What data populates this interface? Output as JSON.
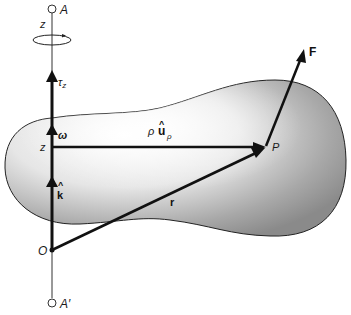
{
  "figure": {
    "colors": {
      "ink": "#111111",
      "body_light": "#f4f4f4",
      "body_dark": "#8a8a8a",
      "axis_thin": "#333333"
    },
    "labels": {
      "point_A": "A",
      "point_A_prime": "A′",
      "axis_z_top": "z",
      "torque": "τ",
      "torque_sub": "z",
      "omega": "ω",
      "z_point": "z",
      "k_hat": "k",
      "hat": "^",
      "origin": "O",
      "rho": "ρ",
      "u_vec": "u",
      "u_sub": "ρ",
      "point_P": "P",
      "r_vec": "r",
      "force": "F"
    },
    "icons": {
      "rotation": "rotation-arrow-icon"
    }
  }
}
